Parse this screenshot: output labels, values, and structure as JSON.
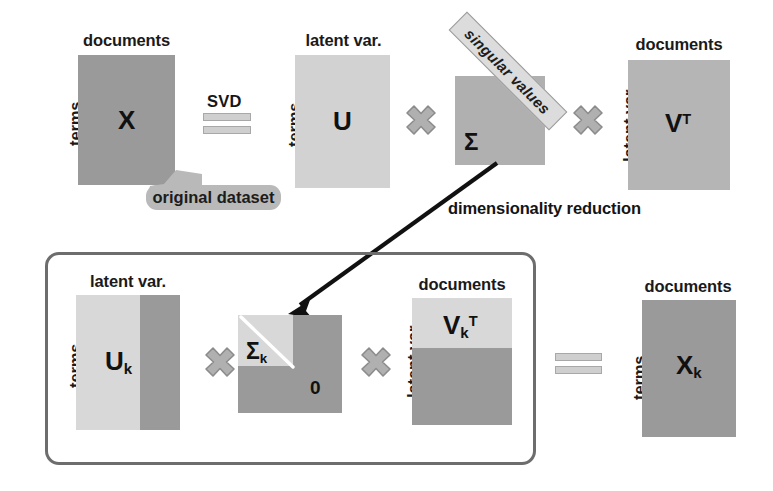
{
  "diagram": {
    "colors": {
      "dark_gray": "#9a9a9a",
      "light_gray": "#d2d2d2",
      "mid_gray": "#b9b9b9",
      "border_gray": "#6d6d6d",
      "text_black": "#141414",
      "banner_fill": "#dcdcdc",
      "cross_fill": "#b0b0b0",
      "cross_stroke": "#8c8c8c",
      "arrow_black": "#111111",
      "background": "#ffffff"
    }
  },
  "top_row": {
    "matrix_x": {
      "label": "X",
      "caption_top": "documents",
      "caption_left": "terms"
    },
    "svd_operator": {
      "word": "SVD",
      "symbol": "equals"
    },
    "matrix_u": {
      "label": "U",
      "caption_top": "latent var.",
      "caption_left": "terms"
    },
    "multiply_1": "×",
    "matrix_sigma": {
      "label": "Σ",
      "banner_text": "singular values"
    },
    "multiply_2": "×",
    "matrix_vt": {
      "label": "V",
      "superscript": "T",
      "caption_top": "documents",
      "caption_left": "latent var."
    },
    "callout": {
      "text": "original dataset"
    }
  },
  "annotation": {
    "dimensionality_reduction": "dimensionality reduction"
  },
  "bottom_row": {
    "matrix_uk": {
      "label": "U",
      "subscript": "k",
      "caption_top": "latent var.",
      "caption_left": "terms"
    },
    "multiply_1": "×",
    "matrix_sigmak": {
      "label": "Σ",
      "subscript": "k",
      "zero_label": "0"
    },
    "multiply_2": "×",
    "matrix_vkt": {
      "label": "V",
      "subscript": "k",
      "superscript": "T",
      "caption_top": "documents",
      "caption_left": "latent var."
    },
    "equals_operator": {
      "symbol": "equals"
    },
    "matrix_xk": {
      "label": "X",
      "subscript": "k",
      "caption_top": "documents",
      "caption_left": "terms"
    }
  }
}
